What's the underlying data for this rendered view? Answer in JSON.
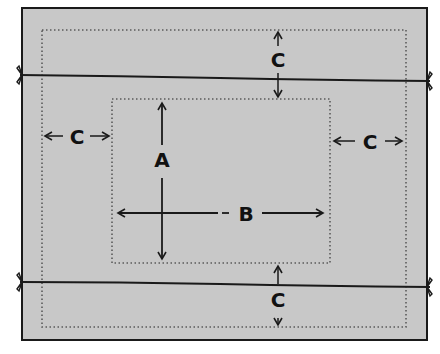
{
  "diagram": {
    "type": "placemat-measurement-diagram",
    "colors": {
      "background": "#ffffff",
      "fabric": "#c8c8c8",
      "line": "#1a1a1a",
      "dotted": "#5a5a5a"
    },
    "labels": {
      "a": "A",
      "b": "B",
      "c_top": "C",
      "c_left": "C",
      "c_right": "C",
      "c_bottom": "C"
    },
    "elements": {
      "outer_fabric": "fabric-panel",
      "outer_hem_line": "dotted-outer-border",
      "inner_area": "dotted-inner-area",
      "top_tie": "tie-line-top",
      "bottom_tie": "tie-line-bottom"
    }
  }
}
